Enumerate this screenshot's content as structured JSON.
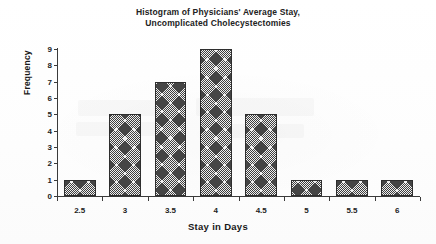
{
  "chart_data": {
    "type": "bar",
    "title": "Histogram of Physicians' Average Stay, Uncomplicated Cholecystectomies",
    "title_lines": [
      "Histogram of Physicians' Average Stay,",
      "Uncomplicated Cholecystectomies"
    ],
    "xlabel": "Stay in Days",
    "ylabel": "Frequency",
    "categories": [
      "2.5",
      "3",
      "3.5",
      "4",
      "4.5",
      "5",
      "5.5",
      "6"
    ],
    "values": [
      1,
      5,
      7,
      9,
      5,
      1,
      1,
      1
    ],
    "ylim": [
      0,
      9
    ],
    "ytick_labels": [
      "0",
      "1",
      "2",
      "3",
      "4",
      "5",
      "6",
      "7",
      "8",
      "9"
    ],
    "grid": false,
    "legend": false,
    "bar_fill": "crosshatch-gray",
    "colors": {
      "axis": "#3a3a3a",
      "text": "#1a1a1a",
      "bar_edge": "#2e2e2e",
      "bar_face": "#bdbdbd",
      "background": "#ffffff"
    }
  }
}
